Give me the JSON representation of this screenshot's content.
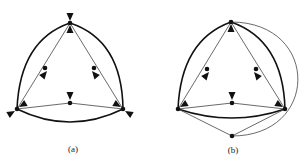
{
  "figure": {
    "panels": [
      {
        "id": "a",
        "caption": "(a)"
      },
      {
        "id": "b",
        "caption": "(b)"
      }
    ]
  },
  "colors": {
    "stroke": "#111111",
    "thin_stroke": "#444444",
    "background": "#ffffff"
  }
}
